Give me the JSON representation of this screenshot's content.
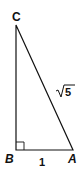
{
  "diagram": {
    "type": "right-triangle",
    "vertices": {
      "A": {
        "label": "A",
        "x": 73,
        "y": 150
      },
      "B": {
        "label": "B",
        "x": 16,
        "y": 150
      },
      "C": {
        "label": "C",
        "x": 16,
        "y": 25
      }
    },
    "right_angle_at": "B",
    "sides": {
      "AB": {
        "label": "1"
      },
      "AC": {
        "label": "√5",
        "radicand": "5"
      }
    },
    "colors": {
      "stroke": "#111111",
      "background": "#ffffff"
    }
  }
}
